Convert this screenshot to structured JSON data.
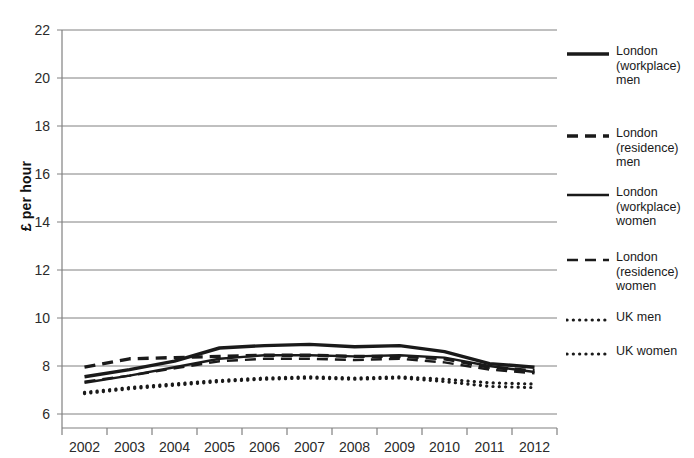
{
  "chart_data": {
    "type": "line",
    "title": "",
    "xlabel": "",
    "ylabel": "£ per hour",
    "categories": [
      "2002",
      "2003",
      "2004",
      "2005",
      "2006",
      "2007",
      "2008",
      "2009",
      "2010",
      "2011",
      "2012"
    ],
    "x": [
      2002,
      2003,
      2004,
      2005,
      2006,
      2007,
      2008,
      2009,
      2010,
      2011,
      2012
    ],
    "ylim": [
      6,
      22
    ],
    "ytick_labels": [
      "6",
      "8",
      "10",
      "12",
      "14",
      "16",
      "18",
      "20",
      "22"
    ],
    "ytick_values": [
      6,
      8,
      10,
      12,
      14,
      16,
      18,
      20,
      22
    ],
    "grid": "horizontal",
    "legend_position": "right",
    "series": [
      {
        "name": "London (workplace) men",
        "label": "London\n(workplace)\nmen",
        "style": "solid-thick",
        "color": "#1a1a1a",
        "values": [
          7.55,
          7.85,
          8.2,
          8.75,
          8.85,
          8.9,
          8.8,
          8.85,
          8.6,
          8.1,
          7.95
        ]
      },
      {
        "name": "London (residence) men",
        "label": "London\n(residence)\nmen",
        "style": "dashed-thick",
        "color": "#1a1a1a",
        "values": [
          7.95,
          8.3,
          8.35,
          8.4,
          8.45,
          8.45,
          8.4,
          8.4,
          8.3,
          7.95,
          7.8
        ]
      },
      {
        "name": "London (workplace) women",
        "label": "London\n(workplace)\nwomen",
        "style": "solid-medium",
        "color": "#1a1a1a",
        "values": [
          7.3,
          7.6,
          7.95,
          8.3,
          8.45,
          8.45,
          8.4,
          8.45,
          8.35,
          8.0,
          7.75
        ]
      },
      {
        "name": "London (residence) women",
        "label": "London\n(residence)\nwomen",
        "style": "dashed-medium",
        "color": "#1a1a1a",
        "values": [
          7.35,
          7.6,
          7.9,
          8.2,
          8.3,
          8.3,
          8.25,
          8.3,
          8.15,
          7.85,
          7.7
        ]
      },
      {
        "name": "UK men",
        "label": "UK men",
        "style": "dotted",
        "color": "#1a1a1a",
        "values": [
          6.9,
          7.1,
          7.25,
          7.4,
          7.5,
          7.55,
          7.5,
          7.55,
          7.45,
          7.3,
          7.25
        ]
      },
      {
        "name": "UK women",
        "label": "UK women",
        "style": "dotted",
        "color": "#1a1a1a",
        "values": [
          6.85,
          7.05,
          7.2,
          7.35,
          7.45,
          7.5,
          7.45,
          7.5,
          7.35,
          7.15,
          7.1
        ]
      }
    ]
  },
  "axis": {
    "y_title": "£ per hour"
  },
  "colors": {
    "line": "#1a1a1a",
    "grid": "#808080",
    "axis": "#808080",
    "background": "#ffffff",
    "text": "#2b2b2b"
  }
}
